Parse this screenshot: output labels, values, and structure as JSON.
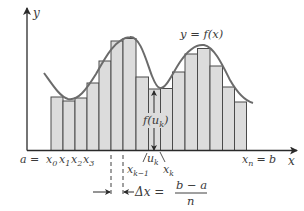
{
  "diagram": {
    "curve_label": "y = f(x)",
    "axes": {
      "x_label": "x",
      "y_label": "y"
    },
    "colors": {
      "bar_fill": "#dcdcdc",
      "bar_stroke": "#4a4a4a",
      "curve": "#6b6b6b",
      "axis": "#2a2a2a",
      "text": "#3a3a3a"
    },
    "baseline_y": 150.5,
    "bars": [
      {
        "x": 51,
        "w": 12,
        "top": 97
      },
      {
        "x": 63,
        "w": 12,
        "top": 101
      },
      {
        "x": 75,
        "w": 12,
        "top": 98
      },
      {
        "x": 87,
        "w": 12,
        "top": 83
      },
      {
        "x": 99,
        "w": 12,
        "top": 61
      },
      {
        "x": 111,
        "w": 12,
        "top": 41
      },
      {
        "x": 123,
        "w": 13,
        "top": 38.5
      },
      {
        "x": 136,
        "w": 12.5,
        "top": 77
      },
      {
        "x": 148.5,
        "w": 12,
        "top": 89
      },
      {
        "x": 160.5,
        "w": 12,
        "top": 88.5
      },
      {
        "x": 172.5,
        "w": 12.5,
        "top": 72
      },
      {
        "x": 185,
        "w": 12.5,
        "top": 54
      },
      {
        "x": 197.5,
        "w": 12.5,
        "top": 48.5
      },
      {
        "x": 210,
        "w": 12.5,
        "top": 66
      },
      {
        "x": 222.5,
        "w": 12,
        "top": 87
      },
      {
        "x": 234.5,
        "w": 12,
        "top": 102
      }
    ],
    "labels": {
      "a_eq": "a =",
      "x0": "x",
      "x0_sub": "0",
      "x1": "x",
      "x1_sub": "1",
      "x2": "x",
      "x2_sub": "2",
      "x3": "x",
      "x3_sub": "3",
      "xk1": "x",
      "xk1_sub": "k−1",
      "uk": "u",
      "uk_sub": "k",
      "xk": "x",
      "xk_sub": "k",
      "xn": "x",
      "xn_sub": "n",
      "eq_b": "= b",
      "fuk_f": "f(u",
      "fuk_sub": "k",
      "fuk_close": ")",
      "delta_x": "Δx =",
      "frac_num": "b − a",
      "frac_den": "n"
    }
  }
}
